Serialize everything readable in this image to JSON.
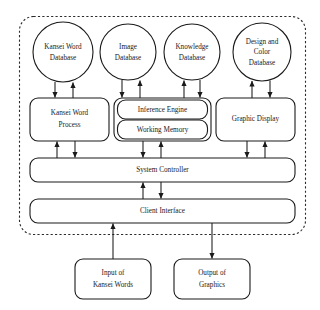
{
  "diagram": {
    "frame": {
      "name": "system-boundary",
      "style": "dashed-rounded-rectangle"
    },
    "databases": [
      {
        "id": "kansei-word-database",
        "lines": [
          "Kansei Word",
          "Database"
        ],
        "shape": "circle"
      },
      {
        "id": "image-database",
        "lines": [
          "Image",
          "Database"
        ],
        "shape": "circle"
      },
      {
        "id": "knowledge-database",
        "lines": [
          "Knowledge",
          "Database"
        ],
        "shape": "circle"
      },
      {
        "id": "design-color-database",
        "lines": [
          "Design and",
          "Color",
          "Database"
        ],
        "shape": "circle"
      }
    ],
    "processes": [
      {
        "id": "kansei-word-process",
        "lines": [
          "Kansei Word",
          "Process"
        ],
        "shape": "rounded-rectangle"
      },
      {
        "id": "inference-engine",
        "lines": [
          "Inference Engine"
        ],
        "shape": "rounded-rectangle"
      },
      {
        "id": "working-memory",
        "lines": [
          "Working Memory"
        ],
        "shape": "rounded-rectangle"
      },
      {
        "id": "graphic-display",
        "lines": [
          "Graphic Display"
        ],
        "shape": "rounded-rectangle"
      }
    ],
    "buses": [
      {
        "id": "system-controller",
        "lines": [
          "System Controller"
        ],
        "shape": "rounded-rectangle"
      },
      {
        "id": "client-interface",
        "lines": [
          "Client Interface"
        ],
        "shape": "rounded-rectangle"
      }
    ],
    "terminals": [
      {
        "id": "input-of-kansei-words",
        "lines": [
          "Input of",
          "Kansei Words"
        ],
        "shape": "rounded-rectangle"
      },
      {
        "id": "output-of-graphics",
        "lines": [
          "Output of",
          "Graphics"
        ],
        "shape": "rounded-rectangle"
      }
    ],
    "connections": [
      {
        "from": "kansei-word-database",
        "to": "kansei-word-process",
        "direction": "down"
      },
      {
        "from": "kansei-word-process",
        "to": "kansei-word-database",
        "direction": "up"
      },
      {
        "from": "image-database",
        "to": "inference-engine",
        "direction": "down"
      },
      {
        "from": "inference-engine",
        "to": "image-database",
        "direction": "up"
      },
      {
        "from": "inference-engine",
        "to": "knowledge-database",
        "direction": "up"
      },
      {
        "from": "knowledge-database",
        "to": "inference-engine",
        "direction": "down"
      },
      {
        "from": "graphic-display",
        "to": "design-color-database",
        "direction": "up"
      },
      {
        "from": "design-color-database",
        "to": "graphic-display",
        "direction": "down"
      },
      {
        "from": "system-controller",
        "to": "kansei-word-process",
        "direction": "up"
      },
      {
        "from": "kansei-word-process",
        "to": "system-controller",
        "direction": "down"
      },
      {
        "from": "working-memory",
        "to": "system-controller",
        "direction": "down"
      },
      {
        "from": "system-controller",
        "to": "working-memory",
        "direction": "up"
      },
      {
        "from": "graphic-display",
        "to": "system-controller",
        "direction": "down"
      },
      {
        "from": "system-controller",
        "to": "graphic-display",
        "direction": "up"
      },
      {
        "from": "client-interface",
        "to": "system-controller",
        "direction": "up"
      },
      {
        "from": "system-controller",
        "to": "client-interface",
        "direction": "down"
      },
      {
        "from": "input-of-kansei-words",
        "to": "client-interface",
        "direction": "up"
      },
      {
        "from": "client-interface",
        "to": "output-of-graphics",
        "direction": "down"
      }
    ],
    "colors": {
      "stroke": "#1a1a1a",
      "frame_stroke": "#2b2b2b",
      "fill": "#ffffff",
      "text": "#1a1a1a"
    }
  }
}
